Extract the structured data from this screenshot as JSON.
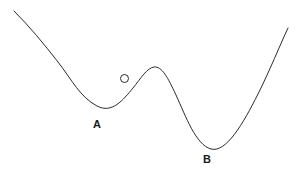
{
  "diagram": {
    "kind": "potential-energy-curve",
    "background_color": "#ffffff",
    "curve_color": "#2b2b2b",
    "curve_width": 1,
    "labels": [
      {
        "id": "a",
        "text": "A",
        "x": 93,
        "y": 119,
        "describes": "shallow-local-minimum"
      },
      {
        "id": "b",
        "text": "B",
        "x": 203,
        "y": 154,
        "describes": "deep-global-minimum"
      }
    ],
    "ball": {
      "name": "ball-marker",
      "cx": 124.5,
      "cy": 78.5,
      "r": 4,
      "fill": "#ffffff",
      "stroke": "#2b2b2b"
    },
    "curve": {
      "path": "M 14 11 C 30 27 44 44 58 62 C 72 80 80 97 97 106 C 112 114 123 100 133 88 C 141 78 147 68 154 67 C 162 66 168 78 176 95 C 186 117 196 145 211 149 C 226 153 243 124 258 94 C 270 70 280 45 288 28",
      "start_point": [
        14,
        11
      ],
      "end_point": [
        288,
        28
      ],
      "minimum_a": [
        97,
        106
      ],
      "barrier_peak": [
        154,
        67
      ],
      "minimum_b": [
        211,
        149
      ]
    }
  },
  "chart_data": {
    "type": "line",
    "title": "",
    "xlabel": "",
    "ylabel": "",
    "grid": false,
    "legend": "none",
    "annotations": [
      "A",
      "B"
    ],
    "series": [
      {
        "name": "potential-energy-curve",
        "x": [
          14,
          40,
          58,
          78,
          97,
          112,
          133,
          154,
          168,
          186,
          196,
          211,
          230,
          258,
          275,
          288
        ],
        "y": [
          11,
          40,
          62,
          92,
          106,
          105,
          88,
          67,
          75,
          113,
          133,
          149,
          143,
          94,
          58,
          28
        ]
      }
    ]
  }
}
